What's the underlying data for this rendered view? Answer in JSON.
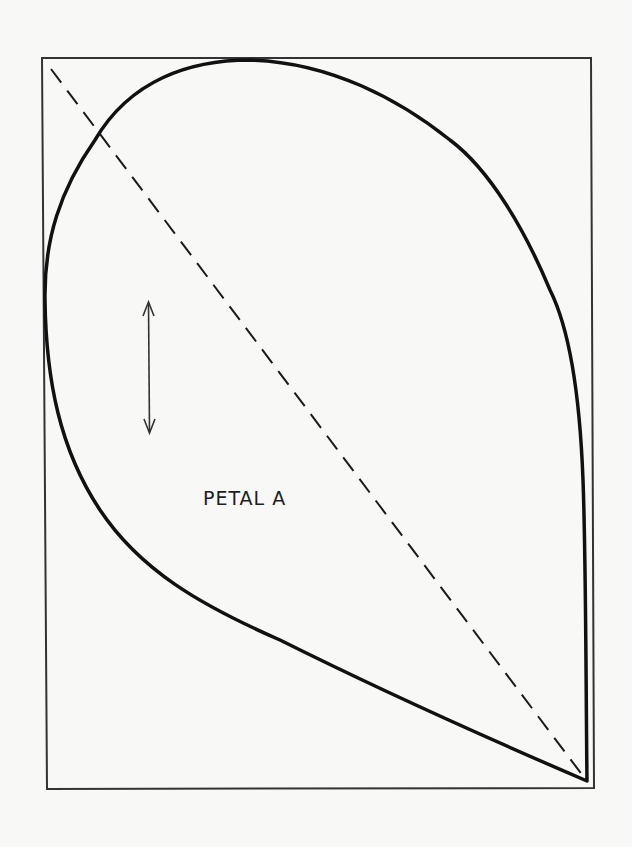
{
  "diagram": {
    "type": "sewing-pattern-piece",
    "piece_label": "PETAL A",
    "elements": {
      "bounding_rectangle": {
        "description": "rectangular outline enclosing the pattern piece"
      },
      "petal_outline": {
        "description": "teardrop-shaped cutting line, rounded at top-left, pointed tip at bottom-right"
      },
      "fold_or_placement_line": {
        "description": "dashed diagonal line from top-left corner to petal tip",
        "style": "dashed"
      },
      "grainline_arrow": {
        "description": "vertical double-headed arrow indicating fabric grain",
        "orientation": "vertical"
      }
    },
    "colors": {
      "background": "#f8f8f6",
      "line": "#1a1a1a",
      "rectangle": "#333333"
    }
  }
}
